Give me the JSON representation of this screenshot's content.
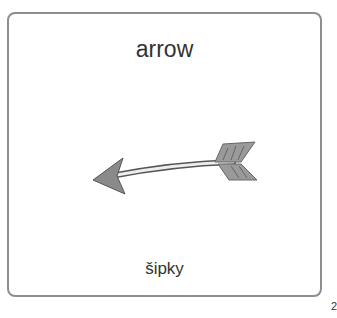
{
  "card": {
    "title": "arrow",
    "subtitle": "šipky",
    "image": "arrow-icon"
  },
  "page_number": "2",
  "colors": {
    "border": "#8e8e8e",
    "text": "#333333",
    "arrow_fill": "#8a8a8a"
  }
}
